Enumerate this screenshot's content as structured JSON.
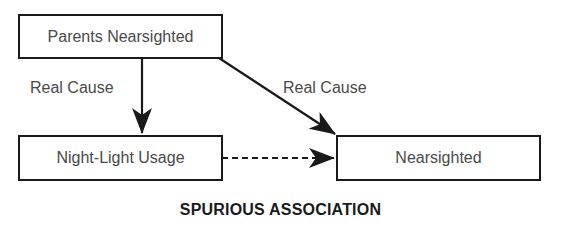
{
  "diagram": {
    "nodes": [
      {
        "id": "parents",
        "label": "Parents Nearsighted"
      },
      {
        "id": "nightlight",
        "label": "Night-Light Usage"
      },
      {
        "id": "nearsighted",
        "label": "Nearsighted"
      }
    ],
    "edges": [
      {
        "from": "parents",
        "to": "nightlight",
        "label": "Real Cause",
        "style": "solid"
      },
      {
        "from": "parents",
        "to": "nearsighted",
        "label": "Real Cause",
        "style": "solid"
      },
      {
        "from": "nightlight",
        "to": "nearsighted",
        "label": "",
        "style": "dashed"
      }
    ],
    "title": "SPURIOUS ASSOCIATION"
  },
  "colors": {
    "stroke": "#1a1a1a",
    "text": "#4a4a4a",
    "background": "#ffffff"
  }
}
